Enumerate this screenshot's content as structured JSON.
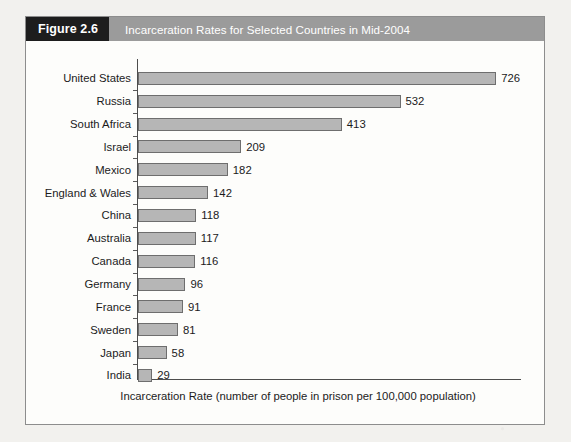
{
  "figure": {
    "number_label": "Figure 2.6",
    "title": "Incarceration Rates for Selected Countries in Mid-2004",
    "header_bg": "#9b9b9b",
    "number_bg": "#1d1d1d",
    "panel_bg": "#fdfdfb"
  },
  "chart_data": {
    "type": "bar",
    "orientation": "horizontal",
    "title": "Incarceration Rates for Selected Countries in Mid-2004",
    "xlabel": "Incarceration Rate (number of people in prison per 100,000 population)",
    "ylabel": "",
    "grid": false,
    "legend": false,
    "xlim": [
      0,
      800
    ],
    "bar_fill": "#b6b6b6",
    "bar_border": "#6e6e6e",
    "value_labels": true,
    "categories": [
      "United States",
      "Russia",
      "South Africa",
      "Israel",
      "Mexico",
      "England & Wales",
      "China",
      "Australia",
      "Canada",
      "Germany",
      "France",
      "Sweden",
      "Japan",
      "India"
    ],
    "values": [
      726,
      532,
      413,
      209,
      182,
      142,
      118,
      117,
      116,
      96,
      91,
      81,
      58,
      29
    ]
  }
}
